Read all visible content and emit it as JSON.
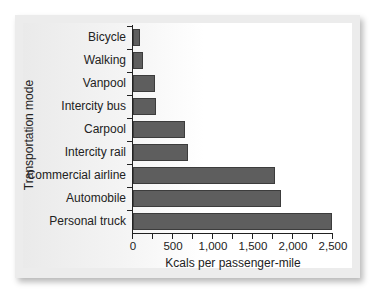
{
  "chart_data": {
    "type": "bar",
    "orientation": "horizontal",
    "title": "",
    "xlabel": "Kcals per passenger-mile",
    "ylabel": "Transportation mode",
    "categories": [
      "Bicycle",
      "Walking",
      "Vanpool",
      "Intercity bus",
      "Carpool",
      "Intercity rail",
      "Commercial airline",
      "Automobile",
      "Personal truck"
    ],
    "values": [
      90,
      130,
      280,
      290,
      650,
      690,
      1780,
      1850,
      2490
    ],
    "xlim": [
      0,
      2500
    ],
    "xticks": [
      0,
      250,
      500,
      750,
      1000,
      1250,
      1500,
      1750,
      2000,
      2250,
      2500
    ],
    "xtick_labels": [
      "0",
      "500",
      "1,000",
      "1,500",
      "2,000",
      "2,500"
    ],
    "grid": false,
    "legend": null,
    "bar_color": "#5e5e5e"
  },
  "labels": {
    "ytitle": "Transportation mode",
    "xtitle": "Kcals per passenger-mile",
    "categories": [
      "Bicycle",
      "Walking",
      "Vanpool",
      "Intercity bus",
      "Carpool",
      "Intercity rail",
      "Commercial airline",
      "Automobile",
      "Personal truck"
    ],
    "xticks": [
      "0",
      "500",
      "1,000",
      "1,500",
      "2,000",
      "2,500"
    ]
  }
}
